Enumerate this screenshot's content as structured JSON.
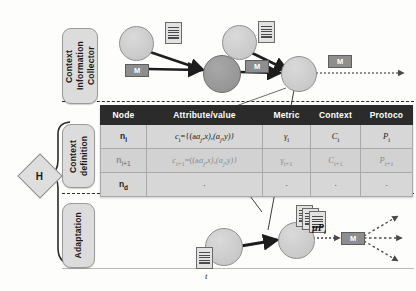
{
  "diagram": {
    "axis_label": "t",
    "hub_label": "H"
  },
  "sections": [
    {
      "name": "collector",
      "label": "Context Information Collector"
    },
    {
      "name": "context-definition",
      "label": "Context definition"
    },
    {
      "name": "adaptation",
      "label": "Adaptation"
    }
  ],
  "messages": {
    "m_label": "M",
    "mu_label": "µP",
    "mu_sub": "i"
  },
  "table": {
    "headers": [
      "Node",
      "Attribute/value",
      "Metric",
      "Context",
      "Protoco"
    ],
    "rows": [
      {
        "node": "n",
        "node_sub": "i",
        "attribute": "c",
        "attribute_sub": "i",
        "attribute_value": "={(a",
        "attribute_value2": ",x),(a",
        "attribute_value3": ",y)}",
        "attr_sub_a": "j",
        "attr_sub_b": "j",
        "metric": "γ",
        "metric_sub": "i",
        "context": "C",
        "context_sub": "i",
        "protocol": "P",
        "protocol_sub": "i"
      },
      {
        "node": "n",
        "node_sub": "i+1",
        "attribute": "c",
        "attribute_sub": "i+1",
        "attribute_value": "=((a",
        "attribute_value2": ",x),(a",
        "attribute_value3": ",y)}",
        "attr_sub_a": "j",
        "attr_sub_b": "j",
        "metric": "γ",
        "metric_sub": "i+1",
        "context": "C",
        "context_sub": "i+1",
        "protocol": "P",
        "protocol_sub": "i+1"
      },
      {
        "node": "n",
        "node_sub": "d",
        "attribute": "·",
        "attribute_sub": "",
        "attribute_value": "",
        "attribute_value2": "",
        "attribute_value3": "",
        "attr_sub_a": "",
        "attr_sub_b": "",
        "metric": "·",
        "metric_sub": "",
        "context": "·",
        "context_sub": "",
        "protocol": "·",
        "protocol_sub": ""
      }
    ]
  },
  "colors": {
    "header_bg": "#2b2b2b",
    "cell_bg": "#d7d7d7",
    "node_light": "#cfcfcf",
    "node_dark": "#989898",
    "label_bg": "#dcdcdc",
    "message_bg": "#8e8e8e"
  }
}
